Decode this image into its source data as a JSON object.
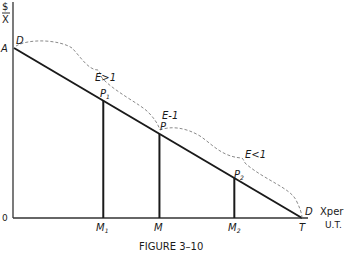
{
  "figure": {
    "caption": "FIGURE 3–10",
    "y_axis_label_top": "$",
    "y_axis_label_bottom": "X",
    "x_axis_label_line1": "Xper",
    "x_axis_label_line2": "U.T.",
    "origin_label": "0",
    "intercept_label": "A",
    "end_label": "T",
    "demand_start_label": "D",
    "demand_end_label": "D",
    "points": [
      {
        "name": "P",
        "sub": "1",
        "t": 0.31
      },
      {
        "name": "P",
        "sub": "",
        "t": 0.505
      },
      {
        "name": "P",
        "sub": "2",
        "t": 0.765
      }
    ],
    "quantities": [
      {
        "name": "M",
        "sub": "1"
      },
      {
        "name": "M",
        "sub": ""
      },
      {
        "name": "M",
        "sub": "2"
      }
    ],
    "elasticity_labels": [
      {
        "text": "E>1"
      },
      {
        "text": "E-1"
      },
      {
        "text": "E<1"
      }
    ],
    "colors": {
      "line": "#1a1a1a",
      "brace": "#8a8a8a",
      "text": "#1a1a1a"
    }
  }
}
